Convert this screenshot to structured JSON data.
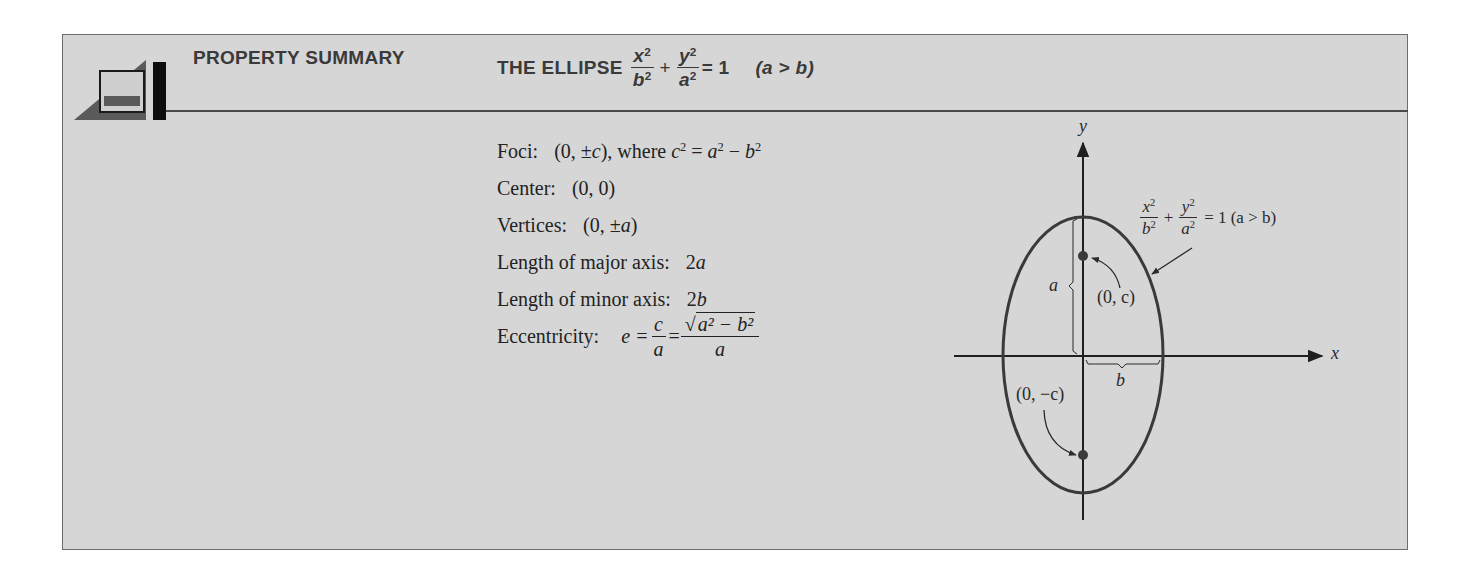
{
  "header": {
    "section_label": "PROPERTY SUMMARY",
    "title_prefix": "THE ELLIPSE",
    "title_eq": {
      "frac1_num": "x",
      "frac1_den": "b",
      "plus": "+",
      "frac2_num": "y",
      "frac2_den": "a",
      "exp": "2",
      "equals": "= 1",
      "condition": "(a > b)"
    }
  },
  "properties": [
    {
      "label": "Foci:",
      "value": "(0, ±c), where c² = a² − b²"
    },
    {
      "label": "Center:",
      "value": "(0, 0)"
    },
    {
      "label": "Vertices:",
      "value": "(0, ±a)"
    },
    {
      "label": "Length of major axis:",
      "value": "2a"
    },
    {
      "label": "Length of minor axis:",
      "value": "2b"
    },
    {
      "label": "Eccentricity:",
      "value": "e = c/a = √(a² − b²)/a"
    }
  ],
  "eccentricity": {
    "lhs": "e =",
    "frac1_num": "c",
    "frac1_den": "a",
    "eq2": "=",
    "frac2_num_radicand": "a² − b²",
    "frac2_den": "a"
  },
  "diagram": {
    "x_axis_label": "x",
    "y_axis_label": "y",
    "equation_label": {
      "num1": "x",
      "den1": "b",
      "num2": "y",
      "den2": "a",
      "exp": "2",
      "rhs": "= 1 (a > b)"
    },
    "upper_focus_label": "(0, c)",
    "lower_focus_label": "(0, −c)",
    "semi_major_label": "a",
    "semi_minor_label": "b",
    "colors": {
      "curve": "#3a3a3a",
      "axis": "#1f1f1f",
      "focus": "#3a3a3a",
      "background": "#d6d6d6"
    }
  }
}
